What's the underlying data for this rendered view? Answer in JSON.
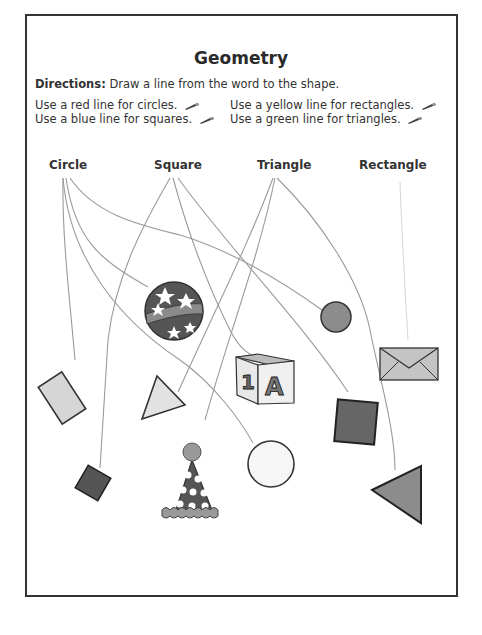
{
  "worksheet": {
    "title": "Geometry",
    "directions_label": "Directions:",
    "directions_text": " Draw a line from the word to the shape.",
    "rules": [
      {
        "text": "Use a red line for circles.",
        "icon": "crayon-icon"
      },
      {
        "text": "Use a blue line for squares.",
        "icon": "crayon-icon"
      },
      {
        "text": "Use a yellow line for rectangles.",
        "icon": "crayon-icon"
      },
      {
        "text": "Use a green line for triangles.",
        "icon": "crayon-icon"
      }
    ],
    "words": [
      "Circle",
      "Square",
      "Triangle",
      "Rectangle"
    ],
    "shapes": [
      {
        "name": "striped-star-ball",
        "category": "Circle"
      },
      {
        "name": "gray-circle",
        "category": "Circle"
      },
      {
        "name": "envelope",
        "category": "Rectangle"
      },
      {
        "name": "alphabet-block",
        "category": "Square"
      },
      {
        "name": "light-rectangle",
        "category": "Rectangle"
      },
      {
        "name": "light-triangle",
        "category": "Triangle"
      },
      {
        "name": "dark-square",
        "category": "Square"
      },
      {
        "name": "small-dark-square",
        "category": "Square"
      },
      {
        "name": "party-hat",
        "category": "Triangle"
      },
      {
        "name": "white-circle",
        "category": "Circle"
      },
      {
        "name": "gray-triangle",
        "category": "Triangle"
      }
    ],
    "block_letters": {
      "left": "1",
      "right": "A"
    },
    "colors": {
      "line": "#9a9a9a",
      "frame": "#333333",
      "shape_dark": "#555555",
      "shape_mid": "#8c8c8c",
      "shape_light": "#d6d6d6"
    }
  }
}
